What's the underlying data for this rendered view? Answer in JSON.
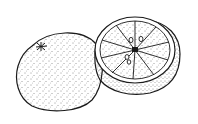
{
  "image": {
    "subject": "Line drawing of an orange: one whole and one cut in half",
    "background": "#ffffff",
    "ink": "#1a1a1a",
    "objects": [
      {
        "name": "whole-orange",
        "description": "Whole orange with stippled peel and star-shaped navel"
      },
      {
        "name": "halved-orange",
        "description": "Orange cut in half showing segments and seeds"
      }
    ],
    "halved_orange": {
      "segments": 10
    }
  }
}
